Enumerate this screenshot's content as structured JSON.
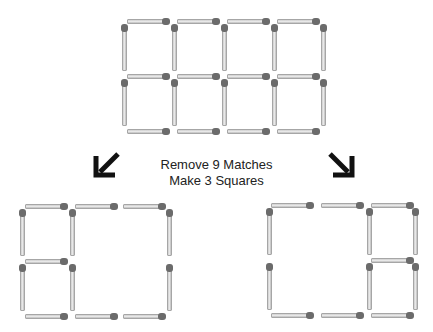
{
  "caption": {
    "line1": "Remove 9 Matches",
    "line2": "Make 3 Squares"
  },
  "arrows": [
    {
      "name": "arrow-down-left-icon",
      "direction": "down-left"
    },
    {
      "name": "arrow-down-right-icon",
      "direction": "down-right"
    }
  ],
  "colors": {
    "match_stick": "#e0e0e0",
    "match_head": "#6b6b6b",
    "text": "#222222"
  },
  "puzzles": {
    "original": {
      "description": "4x2 grid of squares made of matches",
      "columns": 4,
      "rows": 2,
      "match_count": 22
    },
    "solution_left": {
      "description": "Two small squares stacked on left, one large square on right",
      "match_count": 13
    },
    "solution_right": {
      "description": "One large square on left, two small squares stacked on right",
      "match_count": 13
    }
  }
}
